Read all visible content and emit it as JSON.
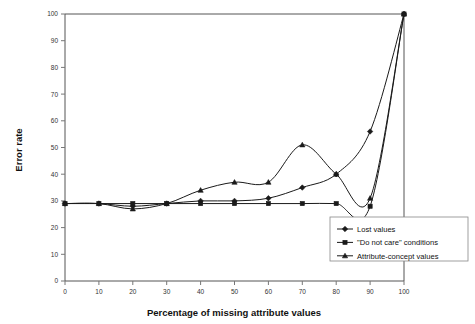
{
  "chart_data": {
    "type": "line",
    "title": "",
    "xlabel": "Percentage of missing attribute values",
    "ylabel": "Error rate",
    "xlim": [
      0,
      100
    ],
    "ylim": [
      0,
      100
    ],
    "xticks": [
      0,
      10,
      20,
      30,
      40,
      50,
      60,
      70,
      80,
      90,
      100
    ],
    "yticks": [
      0,
      10,
      20,
      30,
      40,
      50,
      60,
      70,
      80,
      90,
      100
    ],
    "grid": false,
    "legend_position": "lower right",
    "x": [
      0,
      10,
      20,
      30,
      40,
      50,
      60,
      70,
      80,
      90,
      100
    ],
    "series": [
      {
        "name": "Lost values",
        "marker": "diamond",
        "values": [
          29,
          29,
          28,
          29,
          30,
          30,
          31,
          35,
          40,
          56,
          100
        ]
      },
      {
        "name": "\"Do not care\" conditions",
        "marker": "square",
        "values": [
          29,
          29,
          29,
          29,
          29,
          29,
          29,
          29,
          29,
          28,
          100
        ]
      },
      {
        "name": "Attribute-concept values",
        "marker": "triangle",
        "values": [
          29,
          29,
          27,
          29,
          34,
          37,
          37,
          51,
          40,
          31,
          100
        ]
      }
    ]
  },
  "axes": {
    "ylabel_text": "Error rate",
    "xlabel_text": "Percentage of missing attribute values",
    "x_tick_labels": [
      "0",
      "10",
      "20",
      "30",
      "40",
      "50",
      "60",
      "70",
      "80",
      "90",
      "100"
    ],
    "y_tick_labels": [
      "0",
      "10",
      "20",
      "30",
      "40",
      "50",
      "60",
      "70",
      "80",
      "90",
      "100"
    ]
  },
  "legend": {
    "entries": [
      {
        "label": "Lost values",
        "marker": "diamond-marker-icon"
      },
      {
        "label": "\"Do not care\" conditions",
        "marker": "square-marker-icon"
      },
      {
        "label": "Attribute-concept values",
        "marker": "triangle-marker-icon"
      }
    ]
  },
  "colors": {
    "series": "#1a1a1a",
    "axis": "#555555",
    "background": "#ffffff"
  }
}
